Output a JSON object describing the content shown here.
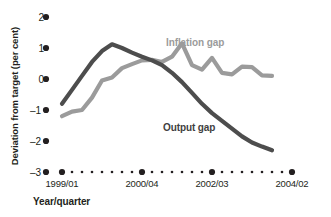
{
  "chart_data": {
    "type": "line",
    "title": "",
    "subtitle": "",
    "xlabel": "Year/quarter",
    "ylabel": "Deviation from target (per cent)",
    "ylim": [
      -3,
      2
    ],
    "yticks": [
      2,
      1,
      0,
      -1,
      -2,
      -3
    ],
    "ytick_labels": [
      "2",
      "1",
      "0",
      "–1",
      "–2",
      "–3"
    ],
    "grid": false,
    "legend_position": "in-plot annotations",
    "x_axis_style": "dotted baseline at -3 with marker dots per quarter",
    "x": [
      "1999/01",
      "1999/02",
      "1999/03",
      "1999/04",
      "2000/01",
      "2000/02",
      "2000/03",
      "2000/04",
      "2001/01",
      "2001/02",
      "2001/03",
      "2001/04",
      "2002/01",
      "2002/02",
      "2002/03",
      "2002/04",
      "2003/01",
      "2003/02",
      "2003/03",
      "2003/04",
      "2004/01",
      "2004/02"
    ],
    "xtick_labels": [
      "1999/01",
      "2000/04",
      "2002/03",
      "2004/02"
    ],
    "xtick_positions": [
      "1999/01",
      "2000/04",
      "2002/03",
      "2004/02"
    ],
    "series": [
      {
        "name": "Output gap",
        "color": "#4d4d4d",
        "values": [
          -0.8,
          -0.35,
          0.1,
          0.55,
          0.9,
          1.12,
          1.0,
          0.85,
          0.72,
          0.6,
          0.45,
          0.2,
          -0.1,
          -0.45,
          -0.8,
          -1.1,
          -1.35,
          -1.6,
          -1.85,
          -2.05,
          -2.18,
          -2.3
        ]
      },
      {
        "name": "Inflation gap",
        "color": "#9b9b9b",
        "values": [
          -1.2,
          -1.05,
          -1.0,
          -0.6,
          -0.05,
          0.05,
          0.35,
          0.48,
          0.6,
          0.62,
          0.55,
          0.72,
          1.15,
          0.45,
          0.3,
          0.68,
          0.2,
          0.15,
          0.4,
          0.38,
          0.12,
          0.1
        ]
      }
    ],
    "annotations": [
      {
        "text": "Inflation gap",
        "color": "#9b9b9b"
      },
      {
        "text": "Output gap",
        "color": "#3f3f3f"
      }
    ]
  },
  "axis": {
    "y_title": "Deviation from target (per cent)",
    "x_title": "Year/quarter",
    "y_tick_0": "2",
    "y_tick_1": "1",
    "y_tick_2": "0",
    "y_tick_3": "–1",
    "y_tick_4": "–2",
    "y_tick_5": "–3",
    "x_tick_0": "1999/01",
    "x_tick_1": "2000/04",
    "x_tick_2": "2002/03",
    "x_tick_3": "2004/02"
  },
  "labels": {
    "inflation": "Inflation gap",
    "output": "Output gap"
  },
  "colors": {
    "inflation": "#9b9b9b",
    "output": "#4d4d4d",
    "text": "#231f20",
    "background": "#ffffff"
  }
}
